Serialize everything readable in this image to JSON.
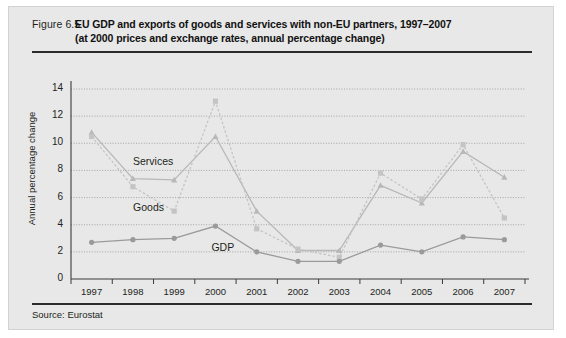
{
  "figure": {
    "number": "Figure 6.5",
    "title_line1": "EU GDP and exports of goods and services with non-EU partners, 1997–2007",
    "title_line2": "(at 2000 prices and exchange rates, annual percentage change)",
    "source": "Source: Eurostat"
  },
  "chart_data": {
    "type": "line",
    "title": "EU GDP and exports of goods and services with non-EU partners, 1997–2007",
    "subtitle": "(at 2000 prices and exchange rates, annual percentage change)",
    "xlabel": "",
    "ylabel": "Annual percentage change",
    "categories": [
      "1997",
      "1998",
      "1999",
      "2000",
      "2001",
      "2002",
      "2003",
      "2004",
      "2005",
      "2006",
      "2007"
    ],
    "x": [
      1997,
      1998,
      1999,
      2000,
      2001,
      2002,
      2003,
      2004,
      2005,
      2006,
      2007
    ],
    "ylim": [
      0,
      14
    ],
    "yticks": [
      0,
      2,
      4,
      6,
      8,
      10,
      12,
      14
    ],
    "grid": true,
    "legend": "inline-labels",
    "series": [
      {
        "name": "Services",
        "marker": "triangle",
        "linestyle": "solid",
        "color": "#b8b8b8",
        "values": [
          10.8,
          7.4,
          7.3,
          10.5,
          5.0,
          2.1,
          2.1,
          6.9,
          5.6,
          9.4,
          7.5
        ]
      },
      {
        "name": "Goods",
        "marker": "square",
        "linestyle": "dotted",
        "color": "#c4c4c4",
        "values": [
          10.5,
          6.8,
          5.0,
          13.1,
          3.7,
          2.2,
          1.6,
          7.8,
          5.9,
          9.9,
          4.5
        ]
      },
      {
        "name": "GDP",
        "marker": "circle",
        "linestyle": "solid",
        "color": "#9a9a9a",
        "values": [
          2.7,
          2.9,
          3.0,
          3.9,
          2.0,
          1.3,
          1.3,
          2.5,
          2.0,
          3.1,
          2.9
        ]
      }
    ],
    "annotations": [
      {
        "text": "Services",
        "x": 1998.1,
        "y": 8.6
      },
      {
        "text": "Goods",
        "x": 1998.1,
        "y": 5.2
      },
      {
        "text": "GDP",
        "x": 2000.0,
        "y": 2.3
      }
    ]
  }
}
